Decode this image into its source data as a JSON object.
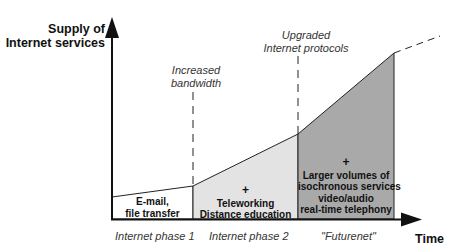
{
  "diagram": {
    "y_axis_label_line1": "Supply of",
    "y_axis_label_line2": "Internet services",
    "x_axis_label": "Time",
    "milestones": [
      {
        "line1": "Increased",
        "line2": "bandwidth"
      },
      {
        "line1": "Upgraded",
        "line2": "Internet protocols"
      }
    ],
    "phases": [
      {
        "name": "Internet phase 1",
        "plus": "",
        "lines": [
          "E-mail,",
          "file transfer"
        ],
        "fill": "#ffffff"
      },
      {
        "name": "Internet phase 2",
        "plus": "+",
        "lines": [
          "Teleworking",
          "Distance education"
        ],
        "fill": "#e3e3e3"
      },
      {
        "name": "\"Futurenet\"",
        "plus": "+",
        "lines": [
          "Larger volumes of",
          "isochronous services",
          "video/audio",
          "real-time telephony"
        ],
        "fill": "#a9a9a9"
      }
    ]
  }
}
